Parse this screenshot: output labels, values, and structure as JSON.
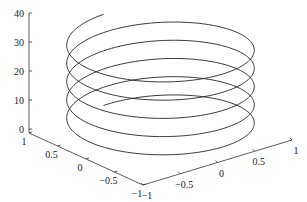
{
  "chart_data": {
    "type": "line",
    "subtype": "3d-line",
    "title": "",
    "xlabel": "",
    "ylabel": "",
    "zlabel": "",
    "series": [
      {
        "name": "helix",
        "x_expr": "cos(t)",
        "y_expr": "sin(t)",
        "z_expr": "t",
        "t_range": [
          0,
          31.4159
        ],
        "color": "#222222"
      }
    ],
    "xlim": [
      -1,
      1
    ],
    "ylim": [
      -1,
      1
    ],
    "zlim": [
      0,
      40
    ],
    "x_ticks": [
      "-1",
      "-0.5",
      "0",
      "0.5",
      "1"
    ],
    "y_ticks": [
      "-1",
      "-0.5",
      "0",
      "0.5",
      "1"
    ],
    "z_ticks": [
      "0",
      "10",
      "20",
      "30",
      "40"
    ],
    "grid": false,
    "legend": null
  },
  "axes": {
    "z_tick_labels": [
      "0",
      "10",
      "20",
      "30",
      "40"
    ],
    "x_tick_labels": [
      "1",
      "0.5",
      "0",
      "-0.5",
      "-1"
    ],
    "y_tick_labels": [
      "-1",
      "-0.5",
      "0",
      "0.5",
      "1"
    ]
  }
}
